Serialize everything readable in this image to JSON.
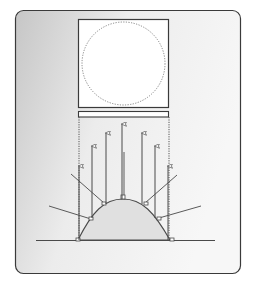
{
  "diagram": {
    "type": "optics-reflection-diagram",
    "colors": {
      "panel_bg_light": "#f3f3f3",
      "panel_bg_dark": "#c9c9c9",
      "panel_border": "#3a3a3a",
      "line": "#4a4a4a",
      "dome_fill": "#e2e2e2",
      "target_fill": "#ffffff",
      "circle_dash": "#777777"
    },
    "elements": {
      "target_square": {
        "x": 78,
        "y": 19,
        "w": 91,
        "h": 88
      },
      "target_circle": {
        "cx": 123,
        "cy": 63,
        "r": 42,
        "style": "dotted"
      },
      "slit_bar": {
        "x": 78,
        "y": 111,
        "w": 91,
        "h": 6
      },
      "baseline": {
        "x1": 36,
        "x2": 215,
        "y": 240
      },
      "dome": {
        "left_x": 78,
        "right_x": 170,
        "base_y": 240,
        "peak_x": 123,
        "peak_y": 199
      },
      "guide_lines": [
        {
          "x": 79,
          "y1": 117,
          "y2": 240,
          "style": "dotted"
        },
        {
          "x": 169,
          "y1": 117,
          "y2": 240,
          "style": "dotted"
        }
      ],
      "reflected_rays": [
        {
          "x": 79,
          "y_from": 240,
          "y_to": 165
        },
        {
          "x": 92,
          "y_from": 218,
          "y_to": 145
        },
        {
          "x": 106,
          "y_from": 205,
          "y_to": 132
        },
        {
          "x": 122,
          "y_from": 199,
          "y_to": 124
        },
        {
          "x": 142,
          "y_from": 204,
          "y_to": 132
        },
        {
          "x": 155,
          "y_from": 218,
          "y_to": 145
        },
        {
          "x": 168,
          "y_from": 240,
          "y_to": 165
        }
      ],
      "incident_rays": [
        {
          "x1": 49,
          "y1": 206,
          "x2": 91,
          "y2": 219
        },
        {
          "x1": 71,
          "y1": 174,
          "x2": 104,
          "y2": 203
        },
        {
          "x1": 124,
          "y1": 152,
          "x2": 124,
          "y2": 197
        },
        {
          "x1": 177,
          "y1": 175,
          "x2": 145,
          "y2": 203
        },
        {
          "x1": 201,
          "y1": 206,
          "x2": 159,
          "y2": 218
        }
      ]
    }
  }
}
